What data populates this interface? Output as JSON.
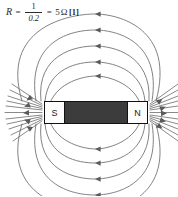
{
  "formula": {
    "variable": "R",
    "equals1": "=",
    "numerator": "1",
    "denominator": "0.2",
    "equals2": "=",
    "result": "5",
    "unit": "Ω",
    "mark": "[1]",
    "full_text": "R = 1/0.2 = 5 Ω [1]"
  },
  "magnet": {
    "south_label": "S",
    "north_label": "N",
    "body_color": "#3c3c3c",
    "pole_color": "#fdfdfd",
    "outline_color": "#111111"
  },
  "diagram": {
    "line_color": "#6b6b6b",
    "arrow_color": "#5a5a5a",
    "background": "#ffffff",
    "field_direction": "north-to-south",
    "loop_count": 5,
    "fan_line_count": 11
  }
}
